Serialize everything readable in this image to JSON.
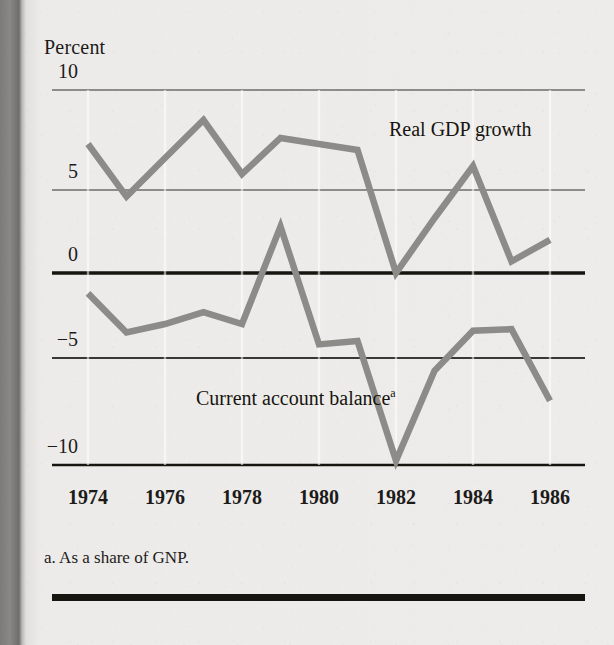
{
  "figure": {
    "axis_title": "Percent",
    "footnote": "a. As a share of GNP.",
    "background_color": "#eceae8",
    "line_color": "#8d8b88",
    "axis_color": "#16150f",
    "gridline_color": "#6e6c6a"
  },
  "chart_data": {
    "type": "line",
    "title": "",
    "subtitle": "",
    "xlabel": "",
    "ylabel": "Percent",
    "ylim": [
      -10,
      10
    ],
    "xlim": [
      1974,
      1986
    ],
    "yticks": [
      10,
      5,
      0,
      -5,
      -10
    ],
    "ytick_labels": [
      "10",
      "5",
      "0",
      "−5",
      "−10"
    ],
    "xticks": [
      1974,
      1976,
      1978,
      1980,
      1982,
      1984,
      1986
    ],
    "xtick_labels": [
      "1974",
      "1976",
      "1978",
      "1980",
      "1982",
      "1984",
      "1986"
    ],
    "x": [
      1974,
      1975,
      1976,
      1977,
      1978,
      1979,
      1980,
      1981,
      1982,
      1983,
      1984,
      1985,
      1986
    ],
    "grid": "horizontal",
    "legend_position": "inline-annotation",
    "annotations": [
      {
        "text": "Real GDP growth",
        "series": "Real GDP growth",
        "x": 1981.1,
        "y": 7.5
      },
      {
        "text": "Current account balance",
        "superscript": "a",
        "series": "Current account balance",
        "x": 1976.4,
        "y": -7.0
      }
    ],
    "footnotes": [
      {
        "marker": "a",
        "text": "As a share of GNP."
      }
    ],
    "series": [
      {
        "name": "Real GDP growth",
        "color": "#8d8b88",
        "values": [
          7.3,
          4.6,
          6.6,
          8.5,
          5.8,
          7.6,
          7.3,
          7.0,
          0.0,
          3.3,
          6.2,
          0.7,
          2.0
        ]
      },
      {
        "name": "Current account balance",
        "color": "#8d8b88",
        "values": [
          -1.2,
          -3.5,
          -3.0,
          -2.3,
          -3.0,
          2.8,
          -4.2,
          -4.0,
          -9.8,
          -5.6,
          -3.4,
          -3.3,
          -7.0
        ]
      }
    ]
  }
}
